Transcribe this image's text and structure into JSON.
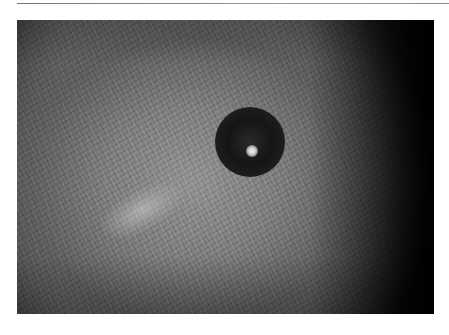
{
  "figure": {
    "type": "grayscale dermoscopic skin photograph",
    "colors": {
      "background": "#ffffff",
      "rule": "#888888",
      "skin_mid": "#6e6e6e",
      "lesion": "#151515",
      "edge_dark": "#000000"
    }
  }
}
